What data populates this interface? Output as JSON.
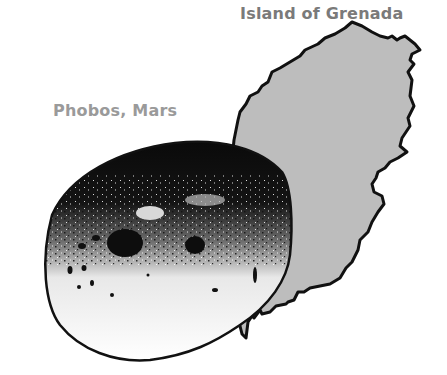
{
  "labels": {
    "island": "Island of Grenada",
    "moon": "Phobos, Mars"
  },
  "colors": {
    "island_fill": "#bdbdbd",
    "outline": "#111111",
    "label_text": "#8e8e8e",
    "background": "#ffffff"
  },
  "objects": [
    {
      "name": "Island of Grenada",
      "shape": "island-outline",
      "fill": "gray"
    },
    {
      "name": "Phobos, Mars",
      "shape": "lumpy-moon",
      "fill": "black-and-white stippled"
    }
  ]
}
